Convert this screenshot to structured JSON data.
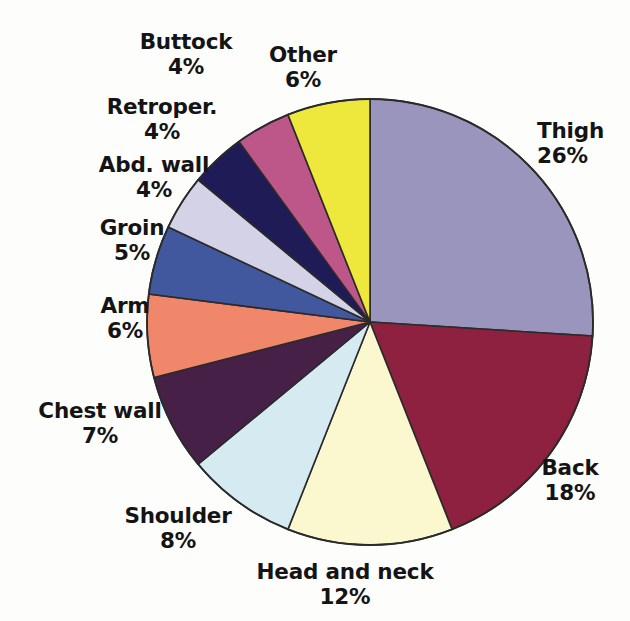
{
  "figure": {
    "kind": "pie-chart",
    "background_color": "#fdfdfc",
    "label_color": "#141414",
    "outline_color": "#2b2b2b",
    "center": {
      "x": 370,
      "y": 322
    },
    "radius": 223
  },
  "chart_data": {
    "type": "pie",
    "title": "",
    "subtitle": "",
    "xlabel": "",
    "ylabel": "",
    "grid": false,
    "legend_position": "none",
    "labels_outside": true,
    "start_angle_deg": 0,
    "direction": "clockwise",
    "units": "percent",
    "total": 100,
    "categories": [
      "Thigh",
      "Back",
      "Head and neck",
      "Shoulder",
      "Chest wall",
      "Arm",
      "Groin",
      "Abd. wall",
      "Retroper.",
      "Buttock",
      "Other"
    ],
    "values": [
      26,
      18,
      12,
      8,
      7,
      6,
      5,
      4,
      4,
      4,
      6
    ],
    "value_labels": [
      "26%",
      "18%",
      "12%",
      "8%",
      "7%",
      "6%",
      "5%",
      "4%",
      "4%",
      "4%",
      "6%"
    ],
    "colors": [
      "#9a95bd",
      "#8e2040",
      "#fbf8d0",
      "#d6eaf2",
      "#472047",
      "#f0876a",
      "#41589e",
      "#d3d2e6",
      "#1f1b56",
      "#bd5689",
      "#efe83c"
    ],
    "slices": [
      {
        "label": "Thigh",
        "value": 26,
        "value_label": "26%",
        "color": "#9a95bd",
        "color_name": "muted-lavender-purple"
      },
      {
        "label": "Back",
        "value": 18,
        "value_label": "18%",
        "color": "#8e2040",
        "color_name": "dark-maroon"
      },
      {
        "label": "Head and neck",
        "value": 12,
        "value_label": "12%",
        "color": "#fbf8d0",
        "color_name": "pale-cream"
      },
      {
        "label": "Shoulder",
        "value": 8,
        "value_label": "8%",
        "color": "#d6eaf2",
        "color_name": "pale-blue"
      },
      {
        "label": "Chest wall",
        "value": 7,
        "value_label": "7%",
        "color": "#472047",
        "color_name": "dark-eggplant"
      },
      {
        "label": "Arm",
        "value": 6,
        "value_label": "6%",
        "color": "#f0876a",
        "color_name": "salmon"
      },
      {
        "label": "Groin",
        "value": 5,
        "value_label": "5%",
        "color": "#41589e",
        "color_name": "medium-blue"
      },
      {
        "label": "Abd. wall",
        "value": 4,
        "value_label": "4%",
        "color": "#d3d2e6",
        "color_name": "light-lavender"
      },
      {
        "label": "Retroper.",
        "value": 4,
        "value_label": "4%",
        "color": "#1f1b56",
        "color_name": "navy"
      },
      {
        "label": "Buttock",
        "value": 4,
        "value_label": "4%",
        "color": "#bd5689",
        "color_name": "magenta-pink"
      },
      {
        "label": "Other",
        "value": 6,
        "value_label": "6%",
        "color": "#efe83c",
        "color_name": "yellow"
      }
    ]
  },
  "labels": {
    "thigh": {
      "name": "Thigh",
      "value": "26%"
    },
    "back": {
      "name": "Back",
      "value": "18%"
    },
    "head_and_neck": {
      "name": "Head and neck",
      "value": "12%"
    },
    "shoulder": {
      "name": "Shoulder",
      "value": "8%"
    },
    "chest_wall": {
      "name": "Chest wall",
      "value": "7%"
    },
    "arm": {
      "name": "Arm",
      "value": "6%"
    },
    "groin": {
      "name": "Groin",
      "value": "5%"
    },
    "abd_wall": {
      "name": "Abd. wall",
      "value": "4%"
    },
    "retroper": {
      "name": "Retroper.",
      "value": "4%"
    },
    "buttock": {
      "name": "Buttock",
      "value": "4%"
    },
    "other": {
      "name": "Other",
      "value": "6%"
    }
  }
}
